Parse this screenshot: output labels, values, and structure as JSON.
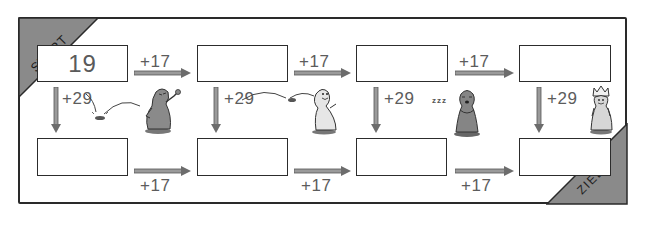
{
  "puzzle": {
    "start_label": "START",
    "goal_label": "ZIEL",
    "horizontal_operation": "+17",
    "vertical_operation": "+29",
    "sleep_text": "zzz",
    "top_row": [
      {
        "value": "19"
      },
      {
        "value": ""
      },
      {
        "value": ""
      },
      {
        "value": ""
      }
    ],
    "bottom_row": [
      {
        "value": ""
      },
      {
        "value": ""
      },
      {
        "value": ""
      },
      {
        "value": ""
      }
    ],
    "top_ops": [
      "+17",
      "+17",
      "+17"
    ],
    "bottom_ops": [
      "+17",
      "+17",
      "+17"
    ],
    "down_ops": [
      "+29",
      "+29",
      "+29",
      "+29"
    ],
    "figures": [
      "angry-pawn",
      "waving-pawn",
      "sleeping-pawn",
      "queen-pawn"
    ]
  },
  "colors": {
    "corner_fill": "#8a8a8a",
    "line": "#2c2c2c",
    "arrow": "#8f8f8f",
    "text": "#5a5a5a"
  }
}
